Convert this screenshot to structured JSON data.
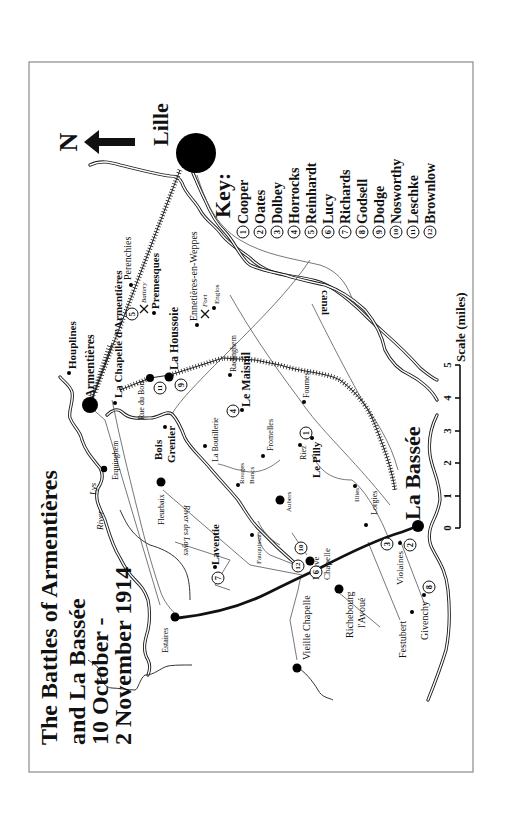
{
  "title": {
    "line1": "The Battles of Armentières",
    "line2": "and La Bassée",
    "line3": "10 October -",
    "line4": "2 November 1914"
  },
  "compass": {
    "letter": "N",
    "icon": "north-arrow-icon"
  },
  "key": {
    "heading": "Key:",
    "items": [
      {
        "num": "1",
        "name": "Cooper"
      },
      {
        "num": "2",
        "name": "Oates"
      },
      {
        "num": "3",
        "name": "Dolbey"
      },
      {
        "num": "4",
        "name": "Horrocks"
      },
      {
        "num": "5",
        "name": "Reinhardt"
      },
      {
        "num": "6",
        "name": "Lucy"
      },
      {
        "num": "7",
        "name": "Richards"
      },
      {
        "num": "8",
        "name": "Godsell"
      },
      {
        "num": "9",
        "name": "Dodge"
      },
      {
        "num": "10",
        "name": "Nosworthy"
      },
      {
        "num": "11",
        "name": "Leschke"
      },
      {
        "num": "12",
        "name": "Brownlow"
      }
    ]
  },
  "scale": {
    "label": "Scale (miles)",
    "ticks": [
      "0",
      "1",
      "2",
      "3",
      "4",
      "5"
    ]
  },
  "places": {
    "lille": "Lille",
    "armentieres": "Armentières",
    "houplines": "Houplines",
    "la_chapelle": "La Chapelle d'Armentières",
    "perenchies": "Perenchies",
    "premesques": "Premesques",
    "battery": "Battery",
    "ennetieres": "Ennetières-en-Weppes",
    "fort": "Fort",
    "englos": "Englos",
    "rue_du_bois": "Rue du Bois",
    "la_houssoie": "La Houssoie",
    "radinghem": "Radinghem",
    "le_maisnil": "Le Maisnil",
    "erquinghem": "Erquinghem",
    "bois": "Bois",
    "grenier": "Grenier",
    "la_boutillerie": "La Boutillerie",
    "fromelles": "Fromelles",
    "fournes": "Fournes",
    "riez": "Riez",
    "le_pilly": "Le Pilly",
    "rouges": "Rouges",
    "bancs": "Bancs",
    "aubers": "Aubers",
    "illies": "Illies",
    "fleurbaix": "Fleurbaix",
    "fauquissart": "Fauquissart",
    "lorgies": "Lorgies",
    "la_bassee": "La Bassée",
    "laventie": "Laventie",
    "neuve": "Neuve",
    "chapelle": "Chapelle",
    "violaines": "Violaines",
    "estaires": "Estaires",
    "vieille_chapelle": "Vieille Chapelle",
    "richebourg": "Richebourg",
    "lavoue": "l'Avoué",
    "festubert": "Festubert",
    "givenchy": "Givenchy",
    "river": "River",
    "lys": "Lys",
    "river_des_layes": "River des Layes",
    "canal": "canal"
  }
}
